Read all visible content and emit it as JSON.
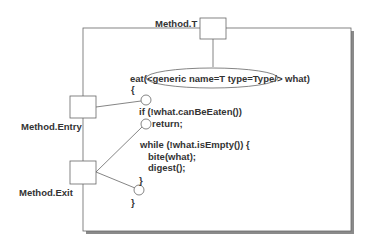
{
  "labels": {
    "method_t": "Method.T",
    "method_entry": "Method.Entry",
    "method_exit": "Method.Exit"
  },
  "code": {
    "line1_prefix": "eat(",
    "line1_generic": "<generic name=T type=Type/>",
    "line1_suffix": " what)",
    "line2": "{",
    "line3": "if (!what.canBeEaten())",
    "line4": "return;",
    "line5": "while (!what.isEmpty()) {",
    "line6": "bite(what);",
    "line7": "digest();",
    "line8": "}",
    "line9": "}"
  },
  "colors": {
    "stroke": "#555555",
    "shadow": "#8a8a8a",
    "text": "#333333"
  }
}
